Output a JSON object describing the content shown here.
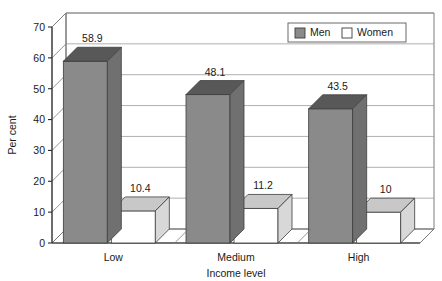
{
  "chart_data": {
    "type": "bar",
    "title": "",
    "subtitle": "",
    "xlabel": "Income level",
    "ylabel": "Per cent",
    "categories": [
      "Low",
      "Medium",
      "High"
    ],
    "series": [
      {
        "name": "Men",
        "values": [
          58.9,
          48.1,
          43.5
        ],
        "color": "#8a8a8a"
      },
      {
        "name": "Women",
        "values": [
          10.4,
          11.2,
          10
        ],
        "color": "#ffffff"
      }
    ],
    "value_labels": [
      [
        "58.9",
        "48.1",
        "43.5"
      ],
      [
        "10.4",
        "11.2",
        "10"
      ]
    ],
    "ylim": [
      0,
      70
    ],
    "yticks": [
      0,
      10,
      20,
      30,
      40,
      50,
      60,
      70
    ],
    "ytick_labels": [
      "0",
      "10",
      "20",
      "30",
      "40",
      "50",
      "60",
      "70"
    ],
    "grid": true,
    "grid_axis": "y",
    "legend_position": "top-right",
    "style": "3d-column"
  },
  "legend": {
    "entries": [
      {
        "label": "Men",
        "swatch": "filled-gray-square"
      },
      {
        "label": "Women",
        "swatch": "empty-white-square"
      }
    ]
  },
  "colors": {
    "men_front": "#8a8a8a",
    "men_top": "#585858",
    "men_side": "#707070",
    "women_front": "#ffffff",
    "women_top": "#c8c8c8",
    "women_side": "#d8d8d8",
    "grid": "#8d8d8d",
    "axis": "#2a2a2a",
    "text": "#1a1a1a",
    "background": "#ffffff"
  }
}
